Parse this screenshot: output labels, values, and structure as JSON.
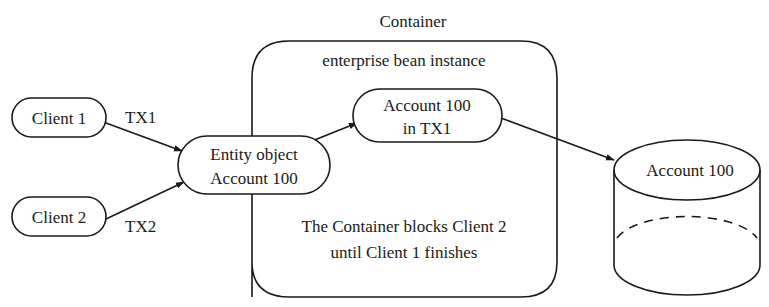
{
  "diagram": {
    "container": {
      "title": "Container",
      "subtitle": "enterprise bean instance",
      "note_line1": "The Container blocks Client 2",
      "note_line2": "until Client 1 finishes"
    },
    "clients": [
      {
        "label": "Client 1",
        "transaction": "TX1"
      },
      {
        "label": "Client 2",
        "transaction": "TX2"
      }
    ],
    "entity_object": {
      "line1": "Entity object",
      "line2": "Account 100"
    },
    "bean_instance": {
      "line1": "Account 100",
      "line2": "in TX1"
    },
    "database": {
      "label": "Account 100"
    },
    "colors": {
      "stroke": "#1a1a1a",
      "background": "#ffffff"
    }
  }
}
